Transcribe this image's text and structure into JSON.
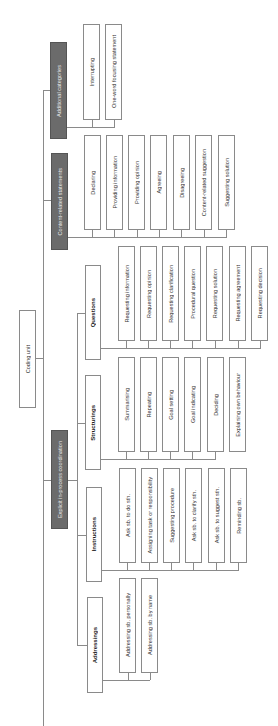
{
  "diagram": {
    "root": "Coding unit",
    "groups": [
      {
        "label": "Additional categories",
        "children": [
          {
            "label": "",
            "leaves": [
              "Interrupting",
              "One-word focusing statement"
            ]
          }
        ]
      },
      {
        "label": "Content-related statements",
        "children": [
          {
            "label": "",
            "leaves": [
              "Declaring",
              "Providing information",
              "Providing opinion",
              "Agreeing",
              "Disagreeing",
              "Content-related suggestion",
              "Suggesting solution"
            ]
          }
        ]
      },
      {
        "label": "Explicit in-process coordination",
        "children": [
          {
            "label": "Questions",
            "leaves": [
              "Requesting information",
              "Requesting opinion",
              "Requesting clarification",
              "Procedural question",
              "Requesting solution",
              "Requesting agreement",
              "Requesting decision"
            ]
          },
          {
            "label": "Structurings",
            "leaves": [
              "Summarising",
              "Repeating",
              "Goal setting",
              "Goal indicating",
              "Deciding",
              "Explaining own behaviour"
            ]
          },
          {
            "label": "Instructions",
            "leaves": [
              "Ask sb. to do sth.",
              "Assigning task or responsibility",
              "Suggesting procedure",
              "Ask sb. to clarify sth.",
              "Ask sb. to suggest sth.",
              "Reminding sb."
            ]
          },
          {
            "label": "Addressings",
            "leaves": [
              "Addressing sb. personally",
              "Addressing sb. by name"
            ]
          }
        ]
      }
    ]
  },
  "colors": {
    "dark_box": "#6b6b6b",
    "line": "#8a8a8a"
  }
}
